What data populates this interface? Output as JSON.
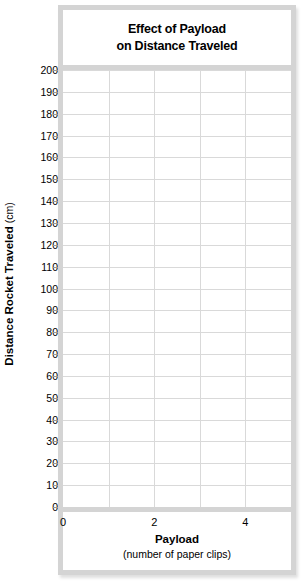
{
  "chart_data": {
    "type": "line",
    "title": "Effect of Payload on Distance Traveled",
    "title_lines": [
      "Effect of Payload",
      "on Distance Traveled"
    ],
    "xlabel": "Payload",
    "xlabel_sub": "(number of paper clips)",
    "ylabel": "Distance Rocket Traveled",
    "ylabel_unit": "(cm)",
    "xlim": [
      0,
      5
    ],
    "ylim": [
      0,
      200
    ],
    "x_ticks": [
      0,
      2,
      4
    ],
    "x_tick_labels": [
      "0",
      "2",
      "4"
    ],
    "y_ticks": [
      0,
      10,
      20,
      30,
      40,
      50,
      60,
      70,
      80,
      90,
      100,
      110,
      120,
      130,
      140,
      150,
      160,
      170,
      180,
      190,
      200
    ],
    "y_tick_labels": [
      "0",
      "10",
      "20",
      "30",
      "40",
      "50",
      "60",
      "70",
      "80",
      "90",
      "100",
      "110",
      "120",
      "130",
      "140",
      "150",
      "160",
      "170",
      "180",
      "190",
      "200"
    ],
    "grid": true,
    "grid_color": "#d9d9d9",
    "frame_color": "#d4d4d4",
    "plot_background": "#ffffff",
    "legend": null,
    "series": [
      {
        "name": "",
        "x": [],
        "values": []
      }
    ],
    "note": "blank grid template; no data plotted"
  },
  "figure": {
    "title_lines": [
      "Effect of Payload",
      "on Distance Traveled"
    ],
    "x_axis": {
      "title": "Payload",
      "subtitle": "(number of paper clips)",
      "tick_labels": [
        "0",
        "2",
        "4"
      ]
    },
    "y_axis": {
      "title": "Distance Rocket Traveled",
      "unit": "(cm)",
      "tick_labels": [
        "200",
        "190",
        "180",
        "170",
        "160",
        "150",
        "140",
        "130",
        "120",
        "110",
        "100",
        "90",
        "80",
        "70",
        "60",
        "50",
        "40",
        "30",
        "20",
        "10",
        "0"
      ]
    }
  }
}
